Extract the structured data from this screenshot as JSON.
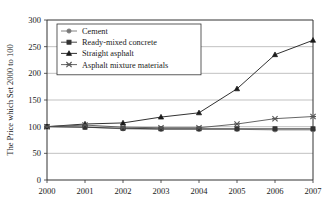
{
  "chart_data": {
    "type": "line",
    "title": "",
    "xlabel": "",
    "ylabel": "The Price which Set 2000 to 100",
    "categories": [
      "2000",
      "2001",
      "2002",
      "2003",
      "2004",
      "2005",
      "2006",
      "2007"
    ],
    "x": [
      2000,
      2001,
      2002,
      2003,
      2004,
      2005,
      2006,
      2007
    ],
    "xlim": [
      2000,
      2007
    ],
    "ylim": [
      0,
      300
    ],
    "yticks": [
      0,
      50,
      100,
      150,
      200,
      250,
      300
    ],
    "ytick_labels": [
      "0",
      "50",
      "100",
      "150",
      "200",
      "250",
      "300"
    ],
    "xtick_labels": [
      "2000",
      "2001",
      "2002",
      "2003",
      "2004",
      "2005",
      "2006",
      "2007"
    ],
    "grid": true,
    "grid_axis": "y",
    "legend_position": "upper-left",
    "series": [
      {
        "name": "Cement",
        "marker": "circle",
        "color": "#777777",
        "values": [
          100,
          99,
          96,
          95,
          95,
          95,
          94,
          94
        ]
      },
      {
        "name": "Ready-mixed concrete",
        "marker": "square",
        "color": "#333333",
        "values": [
          100,
          99,
          97,
          96,
          96,
          96,
          96,
          96
        ]
      },
      {
        "name": "Straight asphalt",
        "marker": "triangle",
        "color": "#1a1a1a",
        "values": [
          100,
          105,
          107,
          118,
          126,
          171,
          235,
          262
        ]
      },
      {
        "name": "Asphalt mixture materials",
        "marker": "x",
        "color": "#555555",
        "values": [
          100,
          103,
          99,
          98,
          98,
          105,
          115,
          119
        ]
      }
    ]
  },
  "axes": {
    "y_axis_title": "The Price which Set 2000 to 100"
  },
  "legend": {
    "entries": [
      {
        "label": "Cement",
        "marker": "circle-marker"
      },
      {
        "label": "Ready-mixed concrete",
        "marker": "square-marker"
      },
      {
        "label": "Straight asphalt",
        "marker": "triangle-marker"
      },
      {
        "label": "Asphalt mixture materials",
        "marker": "x-marker"
      }
    ]
  }
}
